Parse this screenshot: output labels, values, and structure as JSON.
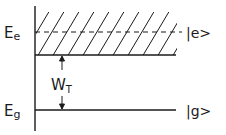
{
  "diagram": {
    "type": "energy-level-diagram",
    "levels": {
      "excited": {
        "energy_label": "E",
        "energy_sub": "e",
        "state_label": "|e>"
      },
      "ground": {
        "energy_label": "E",
        "energy_sub": "g",
        "state_label": "|g>"
      }
    },
    "gap": {
      "label": "W",
      "label_sub": "T"
    },
    "colors": {
      "ink": "#1a1a1a",
      "background": "#ffffff"
    }
  }
}
